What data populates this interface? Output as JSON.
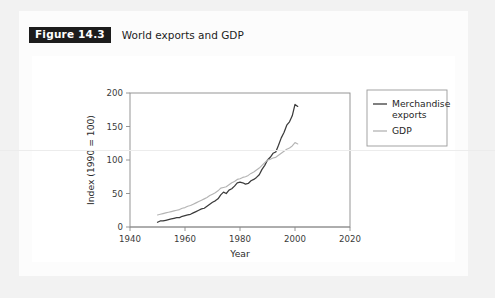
{
  "figure": {
    "badge_label": "Figure 14.3",
    "caption": "World exports and GDP"
  },
  "chart_data": {
    "type": "line",
    "title": "World exports and GDP",
    "xlabel": "Year",
    "ylabel": "Index (1990 = 100)",
    "xlim": [
      1940,
      2020
    ],
    "ylim": [
      0,
      200
    ],
    "xticks": [
      1940,
      1960,
      1980,
      2000,
      2020
    ],
    "yticks": [
      0,
      50,
      100,
      150,
      200
    ],
    "xtick_labels": [
      "1940",
      "1960",
      "1980",
      "2000",
      "2020"
    ],
    "ytick_labels": [
      "0",
      "50",
      "100",
      "150",
      "200"
    ],
    "grid": false,
    "legend_position": "right",
    "series": [
      {
        "name": "Merchandise exports",
        "color": "#3b3b3b",
        "x": [
          1950,
          1951,
          1952,
          1953,
          1954,
          1955,
          1956,
          1957,
          1958,
          1959,
          1960,
          1961,
          1962,
          1963,
          1964,
          1965,
          1966,
          1967,
          1968,
          1969,
          1970,
          1971,
          1972,
          1973,
          1974,
          1975,
          1976,
          1977,
          1978,
          1979,
          1980,
          1981,
          1982,
          1983,
          1984,
          1985,
          1986,
          1987,
          1988,
          1989,
          1990,
          1991,
          1992,
          1993,
          1994,
          1995,
          1996,
          1997,
          1998,
          1999,
          2000,
          2001
        ],
        "values": [
          7,
          9,
          9,
          10,
          11,
          12,
          13,
          14,
          14,
          16,
          17,
          18,
          19,
          21,
          23,
          25,
          27,
          28,
          31,
          34,
          37,
          39,
          42,
          48,
          52,
          50,
          55,
          57,
          61,
          66,
          67,
          66,
          64,
          65,
          69,
          71,
          74,
          78,
          86,
          92,
          100,
          104,
          110,
          112,
          122,
          133,
          141,
          152,
          157,
          166,
          183,
          180
        ]
      },
      {
        "name": "GDP",
        "color": "#b4b4b4",
        "x": [
          1950,
          1951,
          1952,
          1953,
          1954,
          1955,
          1956,
          1957,
          1958,
          1959,
          1960,
          1961,
          1962,
          1963,
          1964,
          1965,
          1966,
          1967,
          1968,
          1969,
          1970,
          1971,
          1972,
          1973,
          1974,
          1975,
          1976,
          1977,
          1978,
          1979,
          1980,
          1981,
          1982,
          1983,
          1984,
          1985,
          1986,
          1987,
          1988,
          1989,
          1990,
          1991,
          1992,
          1993,
          1994,
          1995,
          1996,
          1997,
          1998,
          1999,
          2000,
          2001
        ],
        "values": [
          18,
          19,
          20,
          21,
          22,
          23,
          24,
          25,
          26,
          28,
          29,
          31,
          32,
          34,
          36,
          38,
          40,
          42,
          44,
          47,
          49,
          51,
          54,
          58,
          59,
          60,
          63,
          66,
          68,
          71,
          72,
          74,
          75,
          77,
          80,
          82,
          85,
          88,
          92,
          96,
          100,
          101,
          103,
          104,
          107,
          110,
          113,
          116,
          118,
          121,
          126,
          124
        ]
      }
    ]
  },
  "legend": {
    "entries": [
      {
        "label": "Merchandise exports",
        "color": "#3b3b3b"
      },
      {
        "label": "GDP",
        "color": "#b4b4b4"
      }
    ]
  }
}
